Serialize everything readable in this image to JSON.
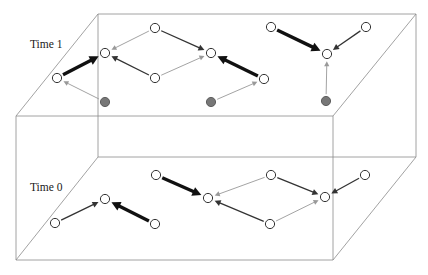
{
  "figure": {
    "width": 428,
    "height": 275,
    "background_color": "#ffffff"
  },
  "colors": {
    "plane_outline": "#8a8a8a",
    "node_outline": "#333333",
    "node_fill": "#ffffff",
    "filled_node_fill": "#777777",
    "filled_node_outline": "#555555",
    "arrow_strong": "#111111",
    "arrow_medium": "#333333",
    "arrow_weak": "#999999",
    "label_text": "#1a1a1a"
  },
  "planes": [
    {
      "name": "time-1-plane",
      "label": "Time 1",
      "label_x": 30,
      "label_y": 48,
      "back_left": [
        98,
        14
      ],
      "back_right": [
        416,
        14
      ],
      "front_right": [
        333,
        116
      ],
      "front_left": [
        16,
        116
      ]
    },
    {
      "name": "time-0-plane",
      "label": "Time 0",
      "label_x": 30,
      "label_y": 191,
      "back_left": [
        98,
        157
      ],
      "back_right": [
        416,
        157
      ],
      "front_right": [
        333,
        260
      ],
      "front_left": [
        16,
        260
      ]
    }
  ],
  "vertical_edges": [
    {
      "name": "edge-back-left",
      "from": [
        98,
        14
      ],
      "to": [
        98,
        157
      ]
    },
    {
      "name": "edge-back-right",
      "from": [
        416,
        14
      ],
      "to": [
        416,
        157
      ]
    },
    {
      "name": "edge-front-right",
      "from": [
        333,
        116
      ],
      "to": [
        333,
        260
      ]
    },
    {
      "name": "edge-front-left",
      "from": [
        16,
        116
      ],
      "to": [
        16,
        260
      ]
    }
  ],
  "nodes": {
    "time_1": [
      {
        "id": "t1-n1",
        "x": 57,
        "y": 78,
        "type": "open",
        "r": 4.6
      },
      {
        "id": "t1-n2",
        "x": 105,
        "y": 53,
        "type": "open",
        "r": 4.6
      },
      {
        "id": "t1-n3",
        "x": 155,
        "y": 28,
        "type": "open",
        "r": 4.6
      },
      {
        "id": "t1-n4",
        "x": 155,
        "y": 78,
        "type": "open",
        "r": 4.6
      },
      {
        "id": "t1-n5",
        "x": 211,
        "y": 53,
        "type": "open",
        "r": 4.6
      },
      {
        "id": "t1-n6",
        "x": 264,
        "y": 79,
        "type": "open",
        "r": 4.6
      },
      {
        "id": "t1-n7",
        "x": 271,
        "y": 27,
        "type": "open",
        "r": 4.6
      },
      {
        "id": "t1-n8",
        "x": 327,
        "y": 54,
        "type": "open",
        "r": 4.6
      },
      {
        "id": "t1-n9",
        "x": 366,
        "y": 27,
        "type": "open",
        "r": 4.6
      },
      {
        "id": "t1-f1",
        "x": 105,
        "y": 102,
        "type": "filled",
        "r": 4.6
      },
      {
        "id": "t1-f2",
        "x": 211,
        "y": 102,
        "type": "filled",
        "r": 4.6
      },
      {
        "id": "t1-f3",
        "x": 326,
        "y": 101,
        "type": "filled",
        "r": 4.6
      }
    ],
    "time_0": [
      {
        "id": "t0-n1",
        "x": 55,
        "y": 223,
        "type": "open",
        "r": 4.6
      },
      {
        "id": "t0-n2",
        "x": 105,
        "y": 199,
        "type": "open",
        "r": 4.6
      },
      {
        "id": "t0-n3",
        "x": 155,
        "y": 224,
        "type": "open",
        "r": 4.6
      },
      {
        "id": "t0-n4",
        "x": 156,
        "y": 175,
        "type": "open",
        "r": 4.6
      },
      {
        "id": "t0-n5",
        "x": 208,
        "y": 198,
        "type": "open",
        "r": 4.6
      },
      {
        "id": "t0-n6",
        "x": 271,
        "y": 175,
        "type": "open",
        "r": 4.6
      },
      {
        "id": "t0-n7",
        "x": 270,
        "y": 224,
        "type": "open",
        "r": 4.6
      },
      {
        "id": "t0-n8",
        "x": 325,
        "y": 197,
        "type": "open",
        "r": 4.6
      },
      {
        "id": "t0-n9",
        "x": 365,
        "y": 175,
        "type": "open",
        "r": 4.6
      }
    ]
  },
  "arrows": {
    "time_1": [
      {
        "id": "t1-a1",
        "from": "t1-n1",
        "to": "t1-n2",
        "weight": "strong"
      },
      {
        "id": "t1-a2",
        "from": "t1-f1",
        "to": "t1-n1",
        "weight": "weak"
      },
      {
        "id": "t1-a3",
        "from": "t1-n3",
        "to": "t1-n2",
        "weight": "weak"
      },
      {
        "id": "t1-a4",
        "from": "t1-n3",
        "to": "t1-n5",
        "weight": "medium"
      },
      {
        "id": "t1-a5",
        "from": "t1-n4",
        "to": "t1-n2",
        "weight": "medium"
      },
      {
        "id": "t1-a6",
        "from": "t1-n4",
        "to": "t1-n5",
        "weight": "weak"
      },
      {
        "id": "t1-a7",
        "from": "t1-n6",
        "to": "t1-n5",
        "weight": "strong"
      },
      {
        "id": "t1-a8",
        "from": "t1-f2",
        "to": "t1-n6",
        "weight": "weak"
      },
      {
        "id": "t1-a9",
        "from": "t1-n7",
        "to": "t1-n8",
        "weight": "strong"
      },
      {
        "id": "t1-a10",
        "from": "t1-n9",
        "to": "t1-n8",
        "weight": "medium"
      },
      {
        "id": "t1-a11",
        "from": "t1-f3",
        "to": "t1-n8",
        "weight": "weak"
      }
    ],
    "time_0": [
      {
        "id": "t0-a1",
        "from": "t0-n1",
        "to": "t0-n2",
        "weight": "medium"
      },
      {
        "id": "t0-a2",
        "from": "t0-n3",
        "to": "t0-n2",
        "weight": "strong"
      },
      {
        "id": "t0-a3",
        "from": "t0-n4",
        "to": "t0-n5",
        "weight": "strong"
      },
      {
        "id": "t0-a4",
        "from": "t0-n6",
        "to": "t0-n5",
        "weight": "weak"
      },
      {
        "id": "t0-a5",
        "from": "t0-n7",
        "to": "t0-n5",
        "weight": "medium"
      },
      {
        "id": "t0-a6",
        "from": "t0-n6",
        "to": "t0-n8",
        "weight": "medium"
      },
      {
        "id": "t0-a7",
        "from": "t0-n7",
        "to": "t0-n8",
        "weight": "weak"
      },
      {
        "id": "t0-a8",
        "from": "t0-n9",
        "to": "t0-n8",
        "weight": "medium"
      }
    ]
  },
  "arrow_styles": {
    "strong": {
      "width": 3.4,
      "color": "#111111",
      "head": 9.0
    },
    "medium": {
      "width": 1.3,
      "color": "#333333",
      "head": 6.0
    },
    "weak": {
      "width": 0.9,
      "color": "#999999",
      "head": 5.0
    }
  }
}
